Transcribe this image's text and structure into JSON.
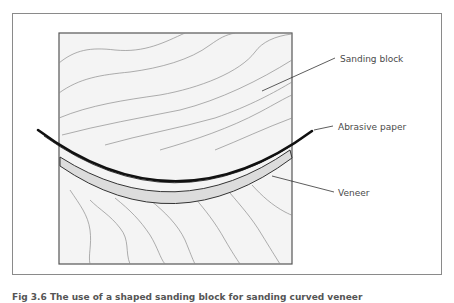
{
  "figure": {
    "labels": {
      "sanding_block": "Sanding block",
      "abrasive_paper": "Abrasive paper",
      "veneer": "Veneer"
    },
    "caption": "Fig 3.6 The use of a shaped sanding block for sanding curved veneer",
    "colors": {
      "frame": "#8a8a8a",
      "block_fill": "#f4f4f4",
      "block_border": "#555555",
      "grain": "#8c8c8c",
      "paper": "#111111",
      "veneer_fill": "#dcdcdc",
      "veneer_outline": "#333333",
      "leader": "#333333"
    }
  }
}
